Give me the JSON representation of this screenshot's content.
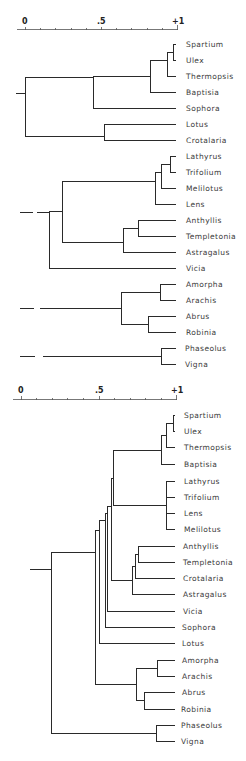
{
  "figure": {
    "type": "dendrogram",
    "panels": 2
  },
  "top_dendrogram": {
    "scale": {
      "labels": [
        "0",
        ".5",
        "+1"
      ],
      "values": [
        0,
        0.5,
        1.0
      ]
    },
    "leaves": [
      "Spartium",
      "Ulex",
      "Thermopsis",
      "Baptisia",
      "Sophora",
      "Lotus",
      "Crotalaria",
      "Lathyrus",
      "Trifolium",
      "Melilotus",
      "Lens",
      "Anthyllis",
      "Templetonia",
      "Astragalus",
      "Vicia",
      "Amorpha",
      "Arachis",
      "Abrus",
      "Robinia",
      "Phaseolus",
      "Vigna"
    ],
    "clusters": [
      {
        "members": [
          "Spartium",
          "Ulex"
        ],
        "level": 0.97
      },
      {
        "members": [
          "Spartium",
          "Ulex",
          "Thermopsis"
        ],
        "level": 0.94
      },
      {
        "members": [
          "Spartium",
          "Ulex",
          "Thermopsis",
          "Baptisia"
        ],
        "level": 0.83
      },
      {
        "members": [
          "Spartium",
          "Ulex",
          "Thermopsis",
          "Baptisia",
          "Sophora"
        ],
        "level": 0.45
      },
      {
        "members": [
          "Lotus",
          "Crotalaria"
        ],
        "level": 0.52
      },
      {
        "members": [
          "Spartium..Sophora",
          "Lotus",
          "Crotalaria"
        ],
        "level": 0.01
      },
      {
        "members": [
          "Lathyrus",
          "Trifolium"
        ],
        "level": 0.96
      },
      {
        "members": [
          "Lathyrus",
          "Trifolium",
          "Melilotus"
        ],
        "level": 0.89
      },
      {
        "members": [
          "Lathyrus",
          "Trifolium",
          "Melilotus",
          "Lens"
        ],
        "level": 0.86
      },
      {
        "members": [
          "Anthyllis",
          "Templetonia"
        ],
        "level": 0.75
      },
      {
        "members": [
          "Anthyllis",
          "Templetonia",
          "Astragalus"
        ],
        "level": 0.65
      },
      {
        "members": [
          "Lathyrus..Lens",
          "Anthyllis..Astragalus"
        ],
        "level": 0.28
      },
      {
        "members": [
          "Lathyrus..Astragalus",
          "Vicia"
        ],
        "level": 0.2
      },
      {
        "members": [
          "Amorpha",
          "Arachis"
        ],
        "level": 0.87
      },
      {
        "members": [
          "Abrus",
          "Robinia"
        ],
        "level": 0.78
      },
      {
        "members": [
          "Amorpha",
          "Arachis",
          "Abrus",
          "Robinia"
        ],
        "level": 0.65
      },
      {
        "members": [
          "Phaseolus",
          "Vigna"
        ],
        "level": 0.9
      }
    ]
  },
  "bottom_dendrogram": {
    "scale": {
      "labels": [
        "0",
        ".5",
        "+1"
      ],
      "values": [
        0,
        0.5,
        1.0
      ]
    },
    "leaves": [
      "Spartium",
      "Ulex",
      "Thermopsis",
      "Baptisia",
      "Lathyrus",
      "Trifolium",
      "Lens",
      "Melilotus",
      "Anthyllis",
      "Templetonia",
      "Crotalaria",
      "Astragalus",
      "Vicia",
      "Sophora",
      "Lotus",
      "Amorpha",
      "Arachis",
      "Abrus",
      "Robinia",
      "Phaseolus",
      "Vigna"
    ],
    "clusters": [
      {
        "members": [
          "Spartium",
          "Ulex"
        ],
        "level": 0.98
      },
      {
        "members": [
          "Spartium",
          "Ulex",
          "Thermopsis"
        ],
        "level": 0.96
      },
      {
        "members": [
          "Spartium",
          "Ulex",
          "Thermopsis",
          "Baptisia"
        ],
        "level": 0.92
      },
      {
        "members": [
          "Lathyrus",
          "Trifolium",
          "Lens",
          "Melilotus"
        ],
        "level": 0.93
      },
      {
        "members": [
          "Spartium..Baptisia",
          "Lathyrus..Melilotus"
        ],
        "level": 0.6
      },
      {
        "members": [
          "Anthyllis",
          "Templetonia"
        ],
        "level": 0.75
      },
      {
        "members": [
          "Anthyllis",
          "Templetonia",
          "Crotalaria"
        ],
        "level": 0.73
      },
      {
        "members": [
          "Anthyllis..Crotalaria",
          "Astragalus"
        ],
        "level": 0.72
      },
      {
        "members": [
          "Spartium..Melilotus",
          "Anthyllis..Astragalus"
        ],
        "level": 0.61
      },
      {
        "members": [
          "...",
          "Vicia"
        ],
        "level": 0.59
      },
      {
        "members": [
          "...",
          "Sophora"
        ],
        "level": 0.57
      },
      {
        "members": [
          "...",
          "Lotus"
        ],
        "level": 0.55
      },
      {
        "members": [
          "Amorpha",
          "Arachis"
        ],
        "level": 0.86
      },
      {
        "members": [
          "Abrus",
          "Robinia"
        ],
        "level": 0.79
      },
      {
        "members": [
          "Amorpha",
          "Arachis",
          "Abrus",
          "Robinia"
        ],
        "level": 0.74
      },
      {
        "members": [
          "Spartium..Lotus",
          "Amorpha..Robinia"
        ],
        "level": 0.53
      },
      {
        "members": [
          "Phaseolus",
          "Vigna"
        ],
        "level": 0.88
      },
      {
        "members": [
          "all"
        ],
        "level": 0.28
      }
    ]
  }
}
